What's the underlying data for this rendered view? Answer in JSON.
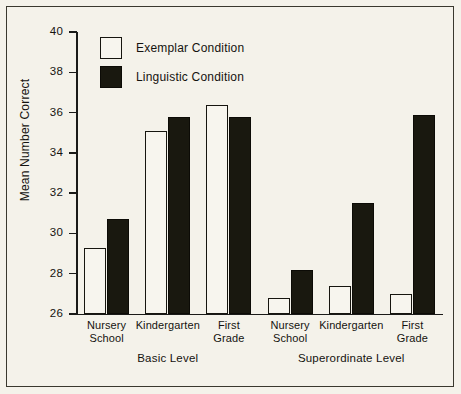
{
  "chart_data": {
    "type": "bar",
    "title": "",
    "subtitle": "",
    "xlabel": "",
    "ylabel": "Mean Number Correct",
    "ylim": [
      26,
      40
    ],
    "yticks": [
      26,
      28,
      30,
      32,
      34,
      36,
      38,
      40
    ],
    "grid": false,
    "legend_position": "top-left",
    "categories": [
      "Nursery School",
      "Kindergarten",
      "First Grade",
      "Nursery School",
      "Kindergarten",
      "First Grade"
    ],
    "groups": [
      {
        "label": "Basic Level",
        "categories": [
          "Nursery School",
          "Kindergarten",
          "First Grade"
        ]
      },
      {
        "label": "Superordinate Level",
        "categories": [
          "Nursery School",
          "Kindergarten",
          "First Grade"
        ]
      }
    ],
    "series": [
      {
        "name": "Exemplar Condition",
        "color": "#f7f5ee",
        "values": [
          29.3,
          35.1,
          36.4,
          26.8,
          27.4,
          27.0
        ]
      },
      {
        "name": "Linguistic Condition",
        "color": "#19180f",
        "values": [
          30.7,
          35.8,
          35.8,
          28.2,
          31.5,
          35.9
        ]
      }
    ]
  },
  "legend": {
    "items": [
      {
        "label": "Exemplar Condition",
        "style": "outline"
      },
      {
        "label": "Linguistic Condition",
        "style": "filled"
      }
    ]
  },
  "axes": {
    "y_label": "Mean Number Correct",
    "y_ticks": [
      "40",
      "38",
      "36",
      "34",
      "32",
      "30",
      "28",
      "26"
    ],
    "x_labels": [
      {
        "line1": "Nursery",
        "line2": "School"
      },
      {
        "line1": "Kindergarten",
        "line2": ""
      },
      {
        "line1": "First",
        "line2": "Grade"
      },
      {
        "line1": "Nursery",
        "line2": "School"
      },
      {
        "line1": "Kindergarten",
        "line2": ""
      },
      {
        "line1": "First",
        "line2": "Grade"
      }
    ],
    "group_labels": [
      "Basic Level",
      "Superordinate Level"
    ]
  },
  "colors": {
    "background": "#f4f2ea",
    "frame": "#3a382f",
    "ink": "#14130f",
    "exemplar_fill": "#f7f5ee",
    "linguistic_fill": "#19180f"
  }
}
